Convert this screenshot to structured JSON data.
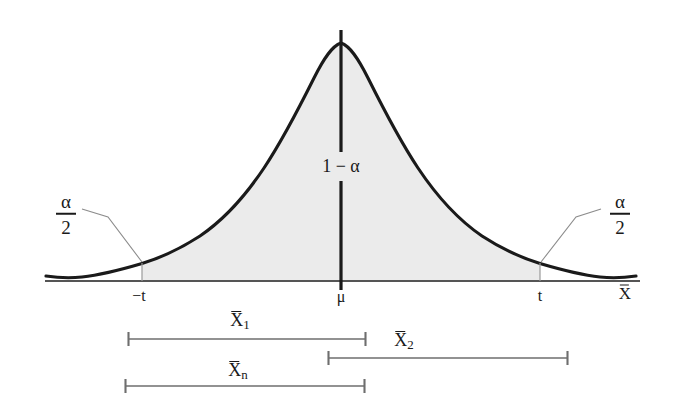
{
  "figure": {
    "colors": {
      "curve": "#1a1a1a",
      "shading": "#ebebeb",
      "axis": "#555555",
      "center_line": "#1a1a1a",
      "tick_line": "#9a9a9a",
      "leader_line": "#8c8c8c",
      "interval_bar": "#6e6e6e",
      "text": "#1a1a1a",
      "background": "#ffffff"
    }
  },
  "axis": {
    "label": "X",
    "label_overline": true,
    "baseline_y": 281,
    "x_start": 45,
    "x_end": 640
  },
  "curve": {
    "type": "bell",
    "peak_x": 341,
    "peak_y": 42,
    "description": "Symmetric bell-shaped probability density curve"
  },
  "regions": {
    "center": {
      "label": "1 − α",
      "meaning": "confidence level",
      "x": 341,
      "y": 166
    },
    "left_tail": {
      "numerator": "α",
      "denominator": "2",
      "x": 66,
      "y": 214
    },
    "right_tail": {
      "numerator": "α",
      "denominator": "2",
      "x": 620,
      "y": 214
    }
  },
  "ticks": [
    {
      "label": "−t",
      "x": 142,
      "text_x": 139,
      "text_y": 296
    },
    {
      "label": "μ",
      "x": 341,
      "text_x": 341,
      "text_y": 297
    },
    {
      "label": "t",
      "x": 540,
      "text_x": 540,
      "text_y": 296
    }
  ],
  "intervals": [
    {
      "label": "X",
      "subscript": "1",
      "x_start": 128,
      "x_end": 366,
      "y": 339,
      "label_x": 240,
      "label_y": 320
    },
    {
      "label": "X",
      "subscript": "2",
      "x_start": 328,
      "x_end": 568,
      "y": 358,
      "label_x": 404,
      "label_y": 340
    },
    {
      "label": "X",
      "subscript": "n",
      "x_start": 125,
      "x_end": 365,
      "y": 386,
      "label_x": 238,
      "label_y": 370
    }
  ]
}
